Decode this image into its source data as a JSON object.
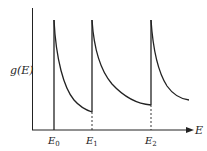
{
  "diagram": {
    "type": "density-of-states",
    "y_axis_label": "g(E)",
    "x_axis_label": "E",
    "tick_labels": [
      {
        "main": "E",
        "sub": "0"
      },
      {
        "main": "E",
        "sub": "1"
      },
      {
        "main": "E",
        "sub": "2"
      }
    ],
    "line_color": "#222222"
  }
}
